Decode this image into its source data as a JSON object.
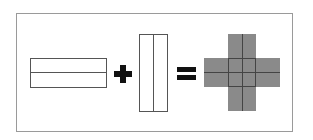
{
  "diagram": {
    "operator_plus": "+",
    "operator_equals": "=",
    "colors": {
      "outline": "#555555",
      "fill_result": "#8a8a8a",
      "operator": "#111111",
      "frame": "#9a9a9a"
    },
    "parts": [
      {
        "name": "horizontal-rectangle",
        "rows": 2,
        "cols": 1,
        "filled": false
      },
      {
        "name": "vertical-rectangle",
        "rows": 1,
        "cols": 2,
        "filled": false
      },
      {
        "name": "cross-result",
        "grid": "4x4 cross",
        "filled": true
      }
    ]
  }
}
